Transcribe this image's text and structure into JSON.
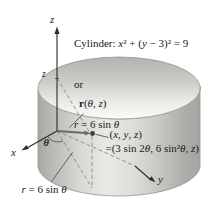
{
  "figure": {
    "title": {
      "line1": [
        "Cylinder: ",
        "x",
        "² + (",
        "y",
        " − 3)² = 9"
      ],
      "line2": "or",
      "line3": [
        "r",
        " = 6 sin ",
        "θ"
      ]
    },
    "axes": {
      "z": "z",
      "x": "x",
      "y": "y"
    },
    "annotations": {
      "z_height": "z",
      "theta": "θ",
      "r_vector": [
        "r",
        "(",
        "θ",
        ", ",
        "z",
        ")"
      ],
      "point": [
        "(",
        "x",
        ", ",
        "y",
        ", ",
        "z",
        ")"
      ],
      "point_eq": [
        "=(3 sin 2",
        "θ",
        ", 6 sin²",
        "θ",
        ", ",
        "z",
        ")"
      ],
      "r_eq": [
        "r",
        " = 6 sin ",
        "θ"
      ]
    },
    "colors": {
      "body_shadow": "#a6a6a2",
      "body_highlight": "#e8e8e4",
      "top_face_dark": "#b2b2ae",
      "top_face_light": "#fbfbf9",
      "axis_line": "#2b2b2b",
      "dashed_line": "#908b85",
      "vector": "#6a6a66",
      "text": "#1b1b1b"
    }
  }
}
